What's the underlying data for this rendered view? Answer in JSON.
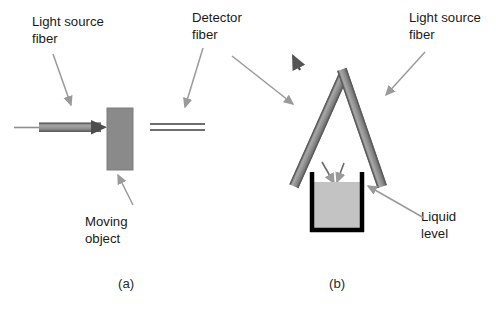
{
  "figure": {
    "background_color": "#ffffff",
    "width": 496,
    "height": 310
  },
  "colors": {
    "fiber_gray": "#8c8c8c",
    "fiber_dark": "#6e6e6e",
    "object_gray": "#8a8a8a",
    "liquid_gray": "#c3c3c3",
    "container_black": "#000000",
    "arrow_gray": "#9a9a9a",
    "text_black": "#1a1a1a"
  },
  "panel_a": {
    "caption": "(a)",
    "labels": {
      "light_source_line1": "Light source",
      "light_source_line2": "fiber",
      "detector_line1": "Detector",
      "detector_line2": "fiber",
      "moving_object_line1": "Moving",
      "moving_object_line2": "object"
    },
    "elements": {
      "light_source_fiber": "horizontal-fiber-with-arrow",
      "detector_fiber": "horizontal-two-line-fiber",
      "moving_object": "gray-rectangle"
    }
  },
  "panel_b": {
    "caption": "(b)",
    "labels": {
      "light_source_line1": "Light source",
      "light_source_line2": "fiber",
      "liquid_level_line1": "Liquid",
      "liquid_level_line2": "level"
    },
    "elements": {
      "detector_fiber": "angled-fiber-up-left",
      "light_source_fiber": "angled-fiber-down-left",
      "container": "open-top-vessel",
      "liquid": "gray-fill"
    }
  }
}
